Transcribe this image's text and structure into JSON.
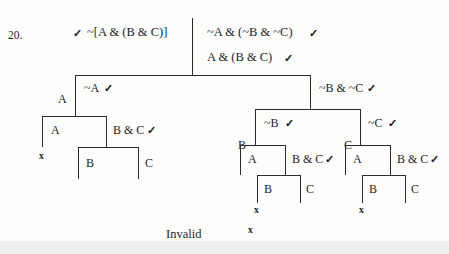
{
  "page": {
    "problem_number": "20.",
    "verdict": "Invalid",
    "verdict_mark": "x",
    "check_glyph": "✓",
    "ink_color": "#1d1d1d",
    "rule_color": "#2a2a2a",
    "background": "#fdfdfc"
  },
  "premises": {
    "left_column": [
      {
        "id": "premise-1",
        "check_before": "✓",
        "text": "~[A & (B & C)]",
        "check_after": ""
      }
    ],
    "right_column": [
      {
        "id": "premise-2",
        "check_before": "",
        "text": "~A & (~B & ~C)",
        "check_after": "✓"
      },
      {
        "id": "negated-conclusion",
        "check_before": "",
        "text": "A & (B & C)",
        "check_after": "✓"
      }
    ]
  },
  "nodes": [
    {
      "id": "node-left-A",
      "text": "A",
      "check": ""
    },
    {
      "id": "node-not-A",
      "text": "~A",
      "check": "✓"
    },
    {
      "id": "node-not-B-not-C",
      "text": "~B & ~C",
      "check": "✓"
    },
    {
      "id": "node-l2-A",
      "text": "A",
      "check": ""
    },
    {
      "id": "node-l2-BandC",
      "text": "B & C",
      "check": "✓"
    },
    {
      "id": "node-l3-B",
      "text": "B",
      "check": ""
    },
    {
      "id": "node-l3-C",
      "text": "C",
      "check": ""
    },
    {
      "id": "node-r-B",
      "text": "B",
      "check": ""
    },
    {
      "id": "node-not-B",
      "text": "~B",
      "check": "✓"
    },
    {
      "id": "node-r-C",
      "text": "C",
      "check": ""
    },
    {
      "id": "node-not-C",
      "text": "~C",
      "check": "✓"
    },
    {
      "id": "node-rl-A",
      "text": "A",
      "check": ""
    },
    {
      "id": "node-rl-BandC",
      "text": "B & C",
      "check": "✓"
    },
    {
      "id": "node-rl-B",
      "text": "B",
      "check": ""
    },
    {
      "id": "node-rl-C",
      "text": "C",
      "check": ""
    },
    {
      "id": "node-rr-A",
      "text": "A",
      "check": ""
    },
    {
      "id": "node-rr-BandC",
      "text": "B & C",
      "check": "✓"
    },
    {
      "id": "node-rr-B",
      "text": "B",
      "check": ""
    },
    {
      "id": "node-rr-C",
      "text": "C",
      "check": ""
    }
  ],
  "closures": [
    {
      "id": "closure-left",
      "mark": "x"
    },
    {
      "id": "closure-right-left",
      "mark": "x"
    },
    {
      "id": "closure-right-right",
      "mark": "x"
    }
  ]
}
